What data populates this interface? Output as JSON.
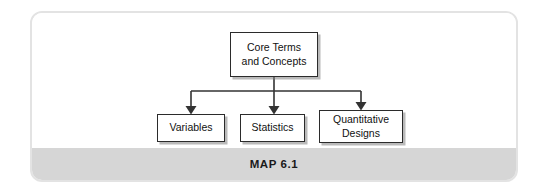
{
  "figure": {
    "caption": "MAP 6.1",
    "frame_color": "#e3e3e3",
    "caption_band_color": "#d6d6d6",
    "node_border_color": "#2b2b2b",
    "connector_color": "#333333"
  },
  "diagram": {
    "type": "hierarchy-flowchart",
    "root": {
      "label": "Core Terms\nand Concepts"
    },
    "children": [
      {
        "label": "Variables"
      },
      {
        "label": "Statistics"
      },
      {
        "label": "Quantitative\nDesigns"
      }
    ]
  }
}
